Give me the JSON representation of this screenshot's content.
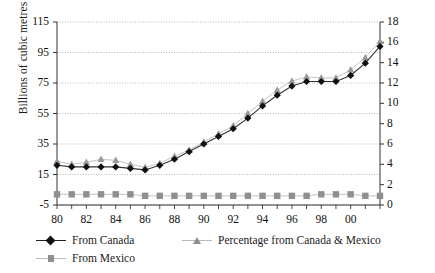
{
  "chart_data": {
    "type": "line",
    "title": "",
    "xlabel": "",
    "ylabel": "Billions of cubic metres",
    "ylabel_right": "% of total U.S. end use",
    "grid": true,
    "legend_position": "bottom",
    "x": [
      "80",
      "81",
      "82",
      "83",
      "84",
      "85",
      "86",
      "87",
      "88",
      "89",
      "90",
      "91",
      "92",
      "93",
      "94",
      "95",
      "96",
      "97",
      "98",
      "99",
      "00",
      "01",
      "02"
    ],
    "xtick_labels": [
      "80",
      "82",
      "84",
      "86",
      "88",
      "90",
      "92",
      "94",
      "96",
      "98",
      "00"
    ],
    "ylim": [
      -5,
      115
    ],
    "yticks": [
      -5,
      15,
      35,
      55,
      75,
      95,
      115
    ],
    "ylim_right": [
      0,
      18
    ],
    "yticks_right": [
      0,
      2,
      4,
      6,
      8,
      10,
      12,
      14,
      16,
      18
    ],
    "series": [
      {
        "name": "From Canada",
        "axis": "left",
        "marker": "diamond",
        "color": "#111111",
        "values": [
          21,
          20,
          20,
          20,
          20,
          19,
          18,
          21,
          25,
          30,
          35,
          40,
          45,
          52,
          60,
          67,
          73,
          76,
          76,
          76,
          80,
          88,
          99
        ]
      },
      {
        "name": "From Mexico",
        "axis": "left",
        "marker": "square",
        "color": "#8f8f8f",
        "values": [
          2,
          2,
          2,
          2,
          2,
          2,
          1,
          1,
          1,
          1,
          1,
          1,
          1,
          1,
          1,
          1,
          1,
          1,
          2,
          2,
          2,
          1,
          1
        ]
      },
      {
        "name": "Percentage from Canada & Mexico",
        "axis": "right",
        "marker": "triangle",
        "color": "#9a9a9a",
        "values": [
          4.3,
          4.0,
          4.2,
          4.5,
          4.4,
          4.0,
          3.7,
          4.1,
          4.8,
          5.4,
          6.2,
          7.0,
          7.8,
          9.0,
          10.2,
          11.3,
          12.2,
          12.6,
          12.5,
          12.5,
          13.3,
          14.5,
          16.1
        ]
      }
    ]
  },
  "legend": {
    "items": [
      {
        "label": "From Canada",
        "marker": "diamond"
      },
      {
        "label": "From Mexico",
        "marker": "square"
      },
      {
        "label": "Percentage from Canada & Mexico",
        "marker": "triangle"
      }
    ]
  }
}
